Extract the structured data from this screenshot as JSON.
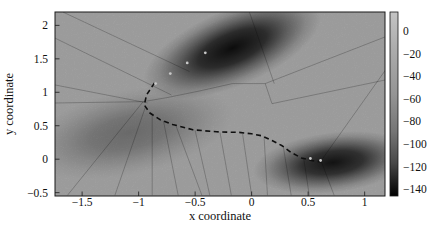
{
  "figure": {
    "background": "#ffffff"
  },
  "chart_data": {
    "type": "heatmap",
    "title": "",
    "xlabel": "x coordinate",
    "ylabel": "y coordinate",
    "x_range": [
      -1.74,
      1.18
    ],
    "y_range": [
      -0.55,
      2.2
    ],
    "grid": false,
    "x_ticks": [
      -1.5,
      -1,
      -0.5,
      0,
      0.5,
      1
    ],
    "x_tick_labels": [
      "−1.5",
      "−1",
      "−0.5",
      "0",
      "0.5",
      "1"
    ],
    "y_ticks": [
      -0.5,
      0,
      0.5,
      1,
      1.5,
      2
    ],
    "y_tick_labels": [
      "−0.5",
      "0",
      "0.5",
      "1",
      "1.5",
      "2"
    ],
    "colorbar": {
      "position": "right",
      "ticks": [
        0,
        -20,
        -40,
        -60,
        -80,
        -100,
        -120,
        -140
      ],
      "tick_labels": [
        "0",
        "−20",
        "−40",
        "−60",
        "−80",
        "−100",
        "−120",
        "−140"
      ],
      "value_range": [
        17,
        -146
      ],
      "gradient": [
        [
          0.0,
          "#c4c4c4"
        ],
        [
          0.2,
          "#acacac"
        ],
        [
          0.45,
          "#949494"
        ],
        [
          0.65,
          "#757575"
        ],
        [
          0.82,
          "#484848"
        ],
        [
          0.93,
          "#1b1b1b"
        ],
        [
          1.0,
          "#000000"
        ]
      ]
    },
    "style": {
      "surface_background": "#a9a9a9",
      "partition_line_color": "rgba(0,0,0,0.28)",
      "frame_color": "#1a1a1a"
    },
    "surface_peaks": [
      {
        "cx": -0.17,
        "cy": 1.66,
        "rx": 0.84,
        "ry": 0.57,
        "angle": -23,
        "peak_alpha": 0.92
      },
      {
        "cx": 0.72,
        "cy": -0.05,
        "rx": 0.71,
        "ry": 0.45,
        "angle": -7,
        "peak_alpha": 0.88
      },
      {
        "cx": -1.08,
        "cy": 0.4,
        "rx": 0.93,
        "ry": 0.63,
        "angle": -12,
        "peak_alpha": 0.32
      }
    ],
    "partition_lines": [
      [
        -1.67,
        2.2,
        -0.55,
        1.31
      ],
      [
        -1.74,
        1.81,
        -0.71,
        0.96
      ],
      [
        -1.74,
        1.11,
        -0.92,
        0.84
      ],
      [
        -1.74,
        0.84,
        -0.96,
        0.86
      ],
      [
        -0.96,
        0.86,
        -0.75,
        0.92
      ],
      [
        -0.75,
        0.92,
        -0.46,
        1.02
      ],
      [
        -0.46,
        1.02,
        -0.17,
        1.13
      ],
      [
        -0.17,
        1.13,
        0.12,
        1.13
      ],
      [
        0.12,
        1.13,
        1.2,
        1.84
      ],
      [
        0.12,
        1.13,
        0.18,
        0.83
      ],
      [
        0.18,
        0.83,
        1.2,
        1.19
      ],
      [
        0.62,
        -0.01,
        1.2,
        1.37
      ],
      [
        -0.02,
        2.2,
        0.2,
        1.13
      ],
      [
        -0.96,
        0.86,
        -1.63,
        -0.54
      ],
      [
        -0.94,
        0.78,
        -1.21,
        -0.54
      ],
      [
        -0.88,
        0.68,
        -0.88,
        -0.54
      ],
      [
        -0.78,
        0.57,
        -0.65,
        -0.54
      ],
      [
        -0.67,
        0.5,
        -0.44,
        -0.54
      ],
      [
        -0.5,
        0.43,
        -0.37,
        -0.54
      ],
      [
        -0.28,
        0.4,
        -0.18,
        -0.54
      ],
      [
        -0.08,
        0.38,
        0.0,
        -0.54
      ],
      [
        0.11,
        0.34,
        0.14,
        -0.54
      ],
      [
        0.28,
        0.19,
        0.35,
        -0.54
      ],
      [
        0.46,
        0.02,
        0.51,
        -0.54
      ],
      [
        0.62,
        -0.05,
        0.73,
        -0.54
      ]
    ],
    "path": {
      "style": "dashed",
      "color": "#111111",
      "points": [
        [
          -0.86,
          1.14
        ],
        [
          -0.93,
          0.96
        ],
        [
          -0.95,
          0.81
        ],
        [
          -0.9,
          0.69
        ],
        [
          -0.81,
          0.59
        ],
        [
          -0.7,
          0.52
        ],
        [
          -0.52,
          0.44
        ],
        [
          -0.31,
          0.41
        ],
        [
          -0.11,
          0.4
        ],
        [
          0.0,
          0.38
        ],
        [
          0.09,
          0.35
        ],
        [
          0.18,
          0.28
        ],
        [
          0.27,
          0.2
        ],
        [
          0.35,
          0.1
        ],
        [
          0.44,
          0.02
        ],
        [
          0.53,
          -0.02
        ],
        [
          0.62,
          -0.04
        ]
      ]
    },
    "markers": {
      "color": "#d9d9d9",
      "points": [
        [
          -0.85,
          1.13
        ],
        [
          -0.72,
          1.28
        ],
        [
          -0.57,
          1.44
        ],
        [
          -0.41,
          1.59
        ],
        [
          0.52,
          0.01
        ],
        [
          0.61,
          -0.02
        ]
      ]
    }
  }
}
